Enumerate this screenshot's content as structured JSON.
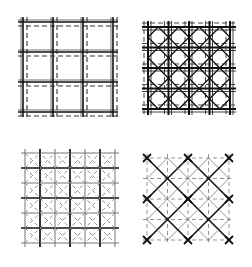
{
  "diagram": {
    "type": "grid-patterns",
    "panels": [
      {
        "id": "top-left",
        "name": "orthogonal-double-grid",
        "origin": [
          23,
          22
        ],
        "size": 90,
        "divisions": 3,
        "solid_color": "#111111",
        "dashed_color": "#333333",
        "dash_offset": 4,
        "diagonals": "none"
      },
      {
        "id": "top-right",
        "name": "orthogonal-grid-with-diagonals",
        "origin": [
          148,
          27
        ],
        "size": 82,
        "divisions": 4,
        "solid_color": "#111111",
        "dashed_color": "#333333",
        "dash_offset": 4,
        "diagonals": "solid-diamond"
      },
      {
        "id": "bottom-left",
        "name": "offset-grid-with-dashed-diagonals",
        "origin": [
          25,
          153
        ],
        "size": 90,
        "divisions": 3,
        "solid_color": "#111111",
        "dashed_color": "#888888",
        "diagonals": "dashed-diamond"
      },
      {
        "id": "bottom-right",
        "name": "diagonal-grid-with-dashed-orthogonals",
        "origin": [
          147,
          158
        ],
        "size": 82,
        "divisions": 4,
        "solid_color": "#111111",
        "dashed_color": "#888888",
        "diagonals": "solid-primary"
      }
    ]
  }
}
